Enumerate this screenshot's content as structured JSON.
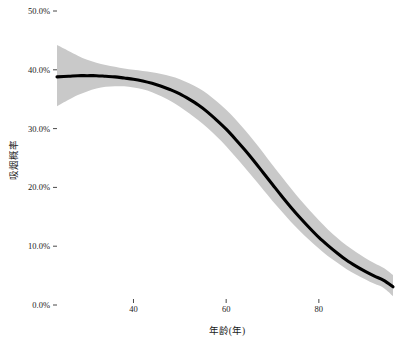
{
  "chart_data": {
    "type": "line",
    "title": "",
    "subtitle": "",
    "xlabel": "年龄(年)",
    "ylabel": "吸烟概率",
    "xlim": [
      23.5,
      96.0
    ],
    "ylim": [
      0.0,
      50.0
    ],
    "grid": false,
    "legend": null,
    "y_tick_labels": [
      "50.0%",
      "40.0%",
      "30.0%",
      "20.0%",
      "10.0%",
      "0.0%"
    ],
    "y_tick_values": [
      50.0,
      40.0,
      30.0,
      20.0,
      10.0,
      0.0
    ],
    "x_tick_labels": [
      "40",
      "60",
      "80"
    ],
    "x_tick_values": [
      40,
      60,
      80
    ],
    "y_unit": "%",
    "series": [
      {
        "name": "吸烟概率",
        "type": "line",
        "color": "#000000",
        "x": [
          23.5,
          26,
          28,
          30,
          32,
          34,
          36,
          38,
          40,
          42,
          44,
          46,
          48,
          50,
          52,
          54,
          56,
          58,
          60,
          62,
          64,
          66,
          68,
          70,
          72,
          74,
          76,
          78,
          80,
          82,
          84,
          86,
          88,
          90,
          92,
          94,
          96
        ],
        "values": [
          38.8,
          38.9,
          39.0,
          39.0,
          39.0,
          38.9,
          38.8,
          38.6,
          38.4,
          38.1,
          37.7,
          37.2,
          36.6,
          35.9,
          35.0,
          34.0,
          32.8,
          31.4,
          29.9,
          28.2,
          26.4,
          24.5,
          22.5,
          20.5,
          18.5,
          16.6,
          14.8,
          13.1,
          11.5,
          10.1,
          8.8,
          7.6,
          6.6,
          5.7,
          4.9,
          4.2,
          3.1
        ]
      },
      {
        "name": "置信区间上界",
        "type": "band-upper",
        "color": "#c9c9c9",
        "x": [
          23.5,
          26,
          28,
          30,
          32,
          34,
          36,
          38,
          40,
          42,
          44,
          46,
          48,
          50,
          52,
          54,
          56,
          58,
          60,
          62,
          64,
          66,
          68,
          70,
          72,
          74,
          76,
          78,
          80,
          82,
          84,
          86,
          88,
          90,
          92,
          94,
          96
        ],
        "values": [
          44.2,
          43.2,
          42.4,
          41.7,
          41.2,
          40.8,
          40.5,
          40.2,
          40.0,
          39.8,
          39.6,
          39.3,
          38.9,
          38.4,
          37.7,
          36.9,
          35.9,
          34.6,
          33.2,
          31.6,
          29.8,
          27.9,
          25.9,
          23.8,
          21.8,
          19.8,
          17.9,
          16.1,
          14.4,
          12.8,
          11.4,
          10.1,
          9.0,
          8.0,
          7.1,
          6.3,
          5.1
        ]
      },
      {
        "name": "置信区间下界",
        "type": "band-lower",
        "color": "#c9c9c9",
        "x": [
          23.5,
          26,
          28,
          30,
          32,
          34,
          36,
          38,
          40,
          42,
          44,
          46,
          48,
          50,
          52,
          54,
          56,
          58,
          60,
          62,
          64,
          66,
          68,
          70,
          72,
          74,
          76,
          78,
          80,
          82,
          84,
          86,
          88,
          90,
          92,
          94,
          96
        ],
        "values": [
          33.8,
          34.9,
          35.7,
          36.3,
          36.8,
          37.1,
          37.2,
          37.2,
          37.0,
          36.7,
          36.2,
          35.5,
          34.7,
          33.7,
          32.6,
          31.4,
          30.1,
          28.6,
          27.0,
          25.2,
          23.4,
          21.5,
          19.6,
          17.7,
          15.9,
          14.1,
          12.5,
          11.0,
          9.6,
          8.3,
          7.2,
          6.1,
          5.2,
          4.4,
          3.6,
          2.9,
          1.5
        ]
      }
    ],
    "annotations": []
  },
  "colors": {
    "line": "#000000",
    "band": "#c9c9c9",
    "text": "#1a1a1a",
    "background": "#ffffff"
  }
}
